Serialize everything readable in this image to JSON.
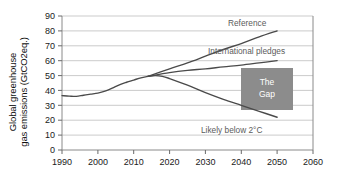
{
  "chart_data": {
    "type": "line",
    "title": "",
    "xlabel": "",
    "ylabel": "Global greenhouse\ngas emissions (GtCO2eq.)",
    "xlim": [
      1990,
      2060
    ],
    "ylim": [
      0,
      90
    ],
    "xticks": [
      1990,
      2000,
      2010,
      2020,
      2030,
      2040,
      2050,
      2060
    ],
    "yticks": [
      0,
      10,
      20,
      30,
      40,
      50,
      60,
      70,
      80,
      90
    ],
    "grid": "horizontal",
    "legend_position": "inline-annotations",
    "units": "GtCO2eq.",
    "series": [
      {
        "name": "Historical",
        "label": "",
        "color": "#4a4a4a",
        "x": [
          1990,
          1992,
          1994,
          1996,
          1998,
          2000,
          2002,
          2004,
          2006,
          2008,
          2010,
          2012,
          2014
        ],
        "values": [
          36.5,
          36.2,
          36.0,
          36.8,
          37.5,
          38.2,
          39.5,
          41.5,
          43.8,
          45.5,
          47.0,
          48.5,
          49.5
        ]
      },
      {
        "name": "Reference",
        "label": "Reference",
        "color": "#4a4a4a",
        "x": [
          2014,
          2020,
          2025,
          2030,
          2035,
          2040,
          2045,
          2050
        ],
        "values": [
          49.5,
          54.5,
          58.5,
          63.0,
          67.5,
          71.5,
          76.0,
          80.0
        ]
      },
      {
        "name": "International pledges",
        "label": "International pledges",
        "color": "#4a4a4a",
        "x": [
          2014,
          2020,
          2025,
          2030,
          2035,
          2040,
          2045,
          2050
        ],
        "values": [
          49.5,
          52.0,
          53.5,
          54.5,
          55.8,
          57.0,
          58.5,
          60.0
        ]
      },
      {
        "name": "Likely below 2 degrees C",
        "label": "Likely below 2°C",
        "color": "#4a4a4a",
        "x": [
          2014,
          2016,
          2018,
          2020,
          2025,
          2030,
          2035,
          2040,
          2045,
          2050
        ],
        "values": [
          49.5,
          50.0,
          49.5,
          48.0,
          43.5,
          38.5,
          34.0,
          30.0,
          26.0,
          22.0
        ]
      }
    ],
    "annotations": [
      {
        "name": "the-gap",
        "text_line1": "The",
        "text_line2": "Gap",
        "x_range": [
          2040,
          2050
        ],
        "y_range": [
          32,
          55
        ],
        "color": "#8c8c8c"
      }
    ]
  },
  "axis": {
    "ytick_labels": [
      "90",
      "80",
      "70",
      "60",
      "50",
      "40",
      "30",
      "20",
      "10",
      "0"
    ],
    "xtick_labels": [
      "1990",
      "2000",
      "2010",
      "2020",
      "2030",
      "2040",
      "2050",
      "2060"
    ]
  },
  "labels": {
    "reference": "Reference",
    "international_pledges": "International pledges",
    "likely_below_2c": "Likely below 2°C",
    "gap_line1": "The",
    "gap_line2": "Gap",
    "ylabel_line1": "Global greenhouse",
    "ylabel_line2": "gas emissions (GtCO2eq.)"
  },
  "colors": {
    "line": "#4a4a4a",
    "grid": "#b5b5b5",
    "axis": "#808080",
    "gap_box": "#8c8c8c",
    "annotation_text": "#5b5b5b",
    "tick_text": "#1a1a1a",
    "background": "#ffffff"
  }
}
